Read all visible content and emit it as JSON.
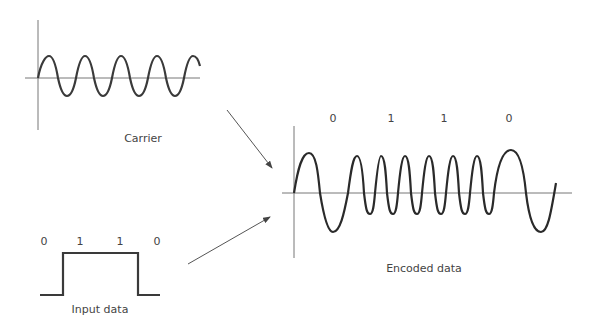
{
  "carrier": {
    "label": "Carrier"
  },
  "input": {
    "label": "Input data",
    "bits": [
      "0",
      "1",
      "1",
      "0"
    ]
  },
  "encoded": {
    "label": "Encoded data",
    "bits": [
      "0",
      "1",
      "1",
      "0"
    ]
  },
  "colors": {
    "wave": "#333333",
    "axis": "#666666",
    "arrow": "#555555",
    "text": "#444444"
  }
}
